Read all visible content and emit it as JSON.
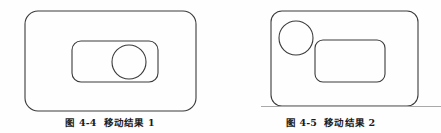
{
  "page": {
    "background_color": "#fefefe",
    "width": 441,
    "height": 133,
    "stroke_color": "#3a3a3a",
    "text_color": "#1b1b1b",
    "rule_color": "#a9a9a9"
  },
  "figures": [
    {
      "id": "fig-4-4",
      "caption_number": "图 4-4",
      "caption_title": "移动结果 1",
      "caption_full": "图 4-4　移动结果 1",
      "shapes": {
        "outer_rect": {
          "name": "outer-rounded-rectangle",
          "x": 25,
          "y": 11,
          "width": 171,
          "height": 100,
          "rx": 13
        },
        "inner_rect": {
          "name": "inner-rounded-rectangle",
          "x": 72,
          "y": 41,
          "width": 86,
          "height": 41,
          "rx": 9
        },
        "circle": {
          "name": "circle",
          "cx": 129,
          "cy": 62,
          "r": 17
        }
      }
    },
    {
      "id": "fig-4-5",
      "caption_number": "图 4-5",
      "caption_title": "移动结果 2",
      "caption_full": "图 4-5　移动结果 2",
      "shapes": {
        "outer_rect": {
          "name": "outer-rounded-rectangle",
          "x": 51,
          "y": 11,
          "width": 147,
          "height": 95,
          "rx": 11
        },
        "inner_rect": {
          "name": "inner-rounded-rectangle",
          "x": 95,
          "y": 40,
          "width": 70,
          "height": 42,
          "rx": 8
        },
        "circle": {
          "name": "circle",
          "cx": 76,
          "cy": 38,
          "r": 17
        }
      }
    }
  ],
  "scan_rule": {
    "name": "page-scan-rule",
    "x": 261,
    "y": 106,
    "width": 180
  }
}
